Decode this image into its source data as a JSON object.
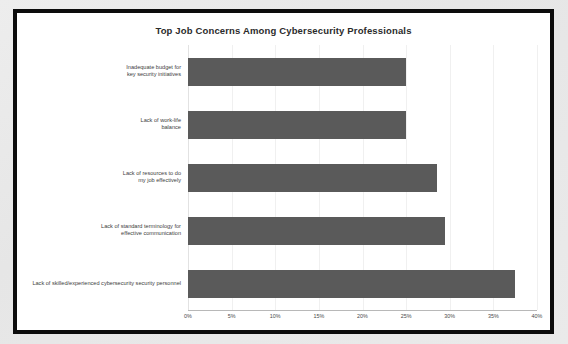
{
  "chart_data": {
    "type": "bar",
    "orientation": "horizontal",
    "title": "Top Job Concerns Among Cybersecurity Professionals",
    "xlabel": "",
    "ylabel": "",
    "xlim": [
      0,
      40
    ],
    "grid": true,
    "legend": "none",
    "tick_labels": [
      "0%",
      "5%",
      "10%",
      "15%",
      "20%",
      "25%",
      "30%",
      "35%",
      "40%"
    ],
    "tick_values": [
      0,
      5,
      10,
      15,
      20,
      25,
      30,
      35,
      40
    ],
    "categories": [
      "Inadequate budget for\nkey security initiatives",
      "Lack of work-life\nbalance",
      "Lack of resources to do\nmy job effectively",
      "Lack of standard terminology for\neffective communication",
      "Lack of skilled/experienced cybersecurity security personnel"
    ],
    "values": [
      25,
      25,
      28.5,
      29.5,
      37.5
    ],
    "value_labels": [
      "25%",
      "25%",
      "28.5%",
      "29.5%",
      "37.5%"
    ],
    "bar_color": "#5a5a5a"
  },
  "style": {
    "frame_border_color": "#0c0c0c",
    "plot_background": "#ffffff",
    "page_background": "#e8e8e8",
    "gridline_color": "#f0f0f0",
    "axis_color": "#b8b8b8",
    "label_color": "#3d3d3d",
    "title_color": "#2b2b2b"
  }
}
